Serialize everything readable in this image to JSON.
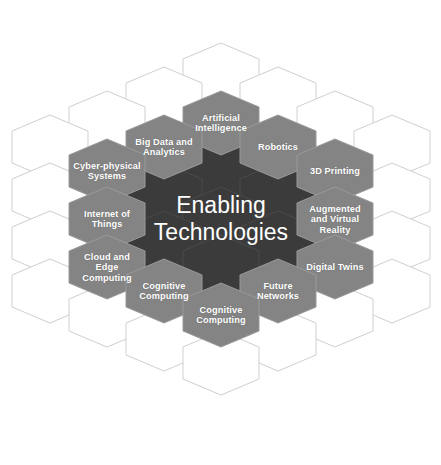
{
  "diagram": {
    "title": "Enabling Technologies",
    "center": {
      "label": "Enabling\nTechnologies"
    },
    "colors": {
      "core_fill": "#3b3b3b",
      "ring_fill": "#848484",
      "empty_fill": "#ffffff",
      "stroke": "#c9c9c9",
      "label_text": "#ffffff",
      "background": "#ffffff"
    },
    "geometry": {
      "hex_width": 76,
      "hex_height": 64,
      "col_pitch": 57,
      "row_pitch": 48,
      "origin_x": 50,
      "origin_y": 51
    },
    "ring_nodes": [
      {
        "label": "Artificial\nIntelligence",
        "col": 3,
        "row": 1.5,
        "name": "artificial-intelligence"
      },
      {
        "label": "Big Data and\nAnalytics",
        "col": 2,
        "row": 2.0,
        "name": "big-data-and-analytics"
      },
      {
        "label": "Robotics",
        "col": 4,
        "row": 2.0,
        "name": "robotics"
      },
      {
        "label": "Cyber-physical\nSystems",
        "col": 1,
        "row": 2.5,
        "name": "cyber-physical-systems"
      },
      {
        "label": "3D Printing",
        "col": 5,
        "row": 2.5,
        "name": "3d-printing"
      },
      {
        "label": "Internet of\nThings",
        "col": 1,
        "row": 3.5,
        "name": "internet-of-things"
      },
      {
        "label": "Augmented\nand Virtual\nReality",
        "col": 5,
        "row": 3.5,
        "name": "augmented-and-virtual-reality"
      },
      {
        "label": "Cloud and\nEdge\nComputing",
        "col": 1,
        "row": 4.5,
        "name": "cloud-and-edge-computing"
      },
      {
        "label": "Digital Twins",
        "col": 5,
        "row": 4.5,
        "name": "digital-twins"
      },
      {
        "label": "Cognitive\nComputing",
        "col": 2,
        "row": 5.0,
        "name": "cognitive-computing-left"
      },
      {
        "label": "Future\nNetworks",
        "col": 4,
        "row": 5.0,
        "name": "future-networks"
      },
      {
        "label": "Cognitive\nComputing",
        "col": 3,
        "row": 5.5,
        "name": "cognitive-computing-bottom"
      }
    ],
    "core_cells": [
      {
        "col": 3,
        "row": 2.5
      },
      {
        "col": 2,
        "row": 3.0
      },
      {
        "col": 4,
        "row": 3.0
      },
      {
        "col": 3,
        "row": 3.5
      },
      {
        "col": 2,
        "row": 4.0
      },
      {
        "col": 4,
        "row": 4.0
      },
      {
        "col": 3,
        "row": 4.5
      }
    ],
    "empty_cells": [
      {
        "col": 3,
        "row": 0.5
      },
      {
        "col": 2,
        "row": 1.0
      },
      {
        "col": 4,
        "row": 1.0
      },
      {
        "col": 1,
        "row": 1.5
      },
      {
        "col": 5,
        "row": 1.5
      },
      {
        "col": 0,
        "row": 2.0
      },
      {
        "col": 6,
        "row": 2.0
      },
      {
        "col": 0,
        "row": 3.0
      },
      {
        "col": 6,
        "row": 3.0
      },
      {
        "col": 0,
        "row": 4.0
      },
      {
        "col": 6,
        "row": 4.0
      },
      {
        "col": 0,
        "row": 5.0
      },
      {
        "col": 6,
        "row": 5.0
      },
      {
        "col": 1,
        "row": 5.5
      },
      {
        "col": 5,
        "row": 5.5
      },
      {
        "col": 2,
        "row": 6.0
      },
      {
        "col": 4,
        "row": 6.0
      },
      {
        "col": 3,
        "row": 6.5
      }
    ]
  }
}
